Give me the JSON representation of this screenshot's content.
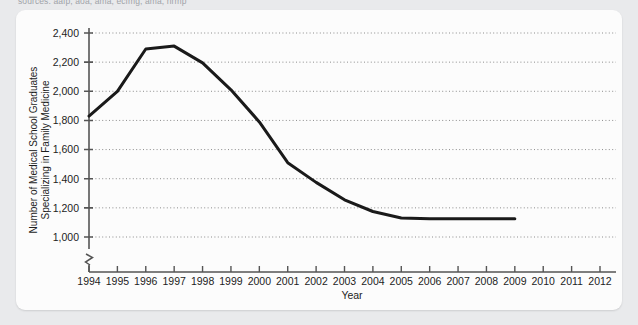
{
  "caption": {
    "text": "sources: aafp, aoa, ama, ecfmg, ama, nrmp"
  },
  "chart_data": {
    "type": "line",
    "title": "",
    "xlabel": "Year",
    "ylabel": "Number of Medical School Graduates Specializing in Family Medicine",
    "ylabel_line1": "Number of Medical School Graduates",
    "ylabel_line2": "Specializing in Family Medicine",
    "x": [
      1994,
      1995,
      1996,
      1997,
      1998,
      1999,
      2000,
      2001,
      2002,
      2003,
      2004,
      2005,
      2006,
      2007,
      2008,
      2009
    ],
    "values": [
      1830,
      2000,
      2290,
      2310,
      2195,
      2010,
      1790,
      1510,
      1375,
      1255,
      1175,
      1130,
      1125,
      1125,
      1125,
      1125
    ],
    "series": [
      {
        "name": "Family Medicine Graduates",
        "values": [
          1830,
          2000,
          2290,
          2310,
          2195,
          2010,
          1790,
          1510,
          1375,
          1255,
          1175,
          1130,
          1125,
          1125,
          1125,
          1125
        ]
      }
    ],
    "x_ticks": [
      "1994",
      "1995",
      "1996",
      "1997",
      "1998",
      "1999",
      "2000",
      "2001",
      "2002",
      "2003",
      "2004",
      "2005",
      "2006",
      "2007",
      "2008",
      "2009",
      "2010",
      "2011",
      "2012"
    ],
    "y_ticks": [
      "1,000",
      "1,200",
      "1,400",
      "1,600",
      "1,800",
      "2,000",
      "2,200",
      "2,400"
    ],
    "y_tick_values": [
      1000,
      1200,
      1400,
      1600,
      1800,
      2000,
      2200,
      2400
    ],
    "xlim": [
      1994,
      2012
    ],
    "ylim": [
      1000,
      2400
    ],
    "y_axis_break": true,
    "grid": "horizontal-dotted",
    "legend": "none",
    "line_color": "#1a1a1a",
    "grid_color": "#8c8c8c",
    "axis_color": "#555555",
    "background_color": "#fcfcfc"
  }
}
